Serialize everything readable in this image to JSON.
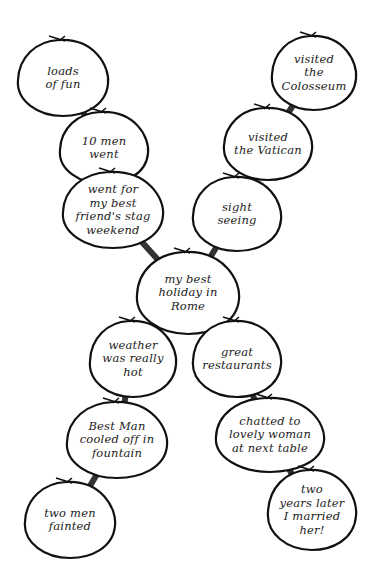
{
  "diagram": {
    "type": "fishbone-bubble-map",
    "central": {
      "id": "center",
      "label": "my best\nholiday in\nRome",
      "cx": 188,
      "cy": 293,
      "rx": 51,
      "ry": 41
    },
    "nodes": [
      {
        "id": "loads-of-fun",
        "label": "loads\nof fun",
        "cx": 63,
        "cy": 78,
        "rx": 45,
        "ry": 38
      },
      {
        "id": "ten-men-went",
        "label": "10 men\nwent",
        "cx": 104,
        "cy": 148,
        "rx": 44,
        "ry": 36
      },
      {
        "id": "stag-weekend",
        "label": "went for\nmy best\nfriend's stag\nweekend",
        "cx": 113,
        "cy": 210,
        "rx": 50,
        "ry": 38
      },
      {
        "id": "colosseum",
        "label": "visited\nthe\nColosseum",
        "cx": 314,
        "cy": 73,
        "rx": 42,
        "ry": 37
      },
      {
        "id": "vatican",
        "label": "visited\nthe Vatican",
        "cx": 268,
        "cy": 144,
        "rx": 44,
        "ry": 36
      },
      {
        "id": "sight-seeing",
        "label": "sight\nseeing",
        "cx": 237,
        "cy": 214,
        "rx": 44,
        "ry": 37
      },
      {
        "id": "weather",
        "label": "weather\nwas really\nhot",
        "cx": 133,
        "cy": 359,
        "rx": 43,
        "ry": 38
      },
      {
        "id": "restaurants",
        "label": "great\nrestaurants",
        "cx": 237,
        "cy": 359,
        "rx": 44,
        "ry": 38
      },
      {
        "id": "best-man",
        "label": "Best Man\ncooled off in\nfountain",
        "cx": 117,
        "cy": 440,
        "rx": 50,
        "ry": 38
      },
      {
        "id": "chatted",
        "label": "chatted to\nlovely woman\nat next table",
        "cx": 270,
        "cy": 435,
        "rx": 54,
        "ry": 37
      },
      {
        "id": "fainted",
        "label": "two men\nfainted",
        "cx": 70,
        "cy": 520,
        "rx": 45,
        "ry": 38
      },
      {
        "id": "married",
        "label": "two\nyears later\nI married\nher!",
        "cx": 312,
        "cy": 510,
        "rx": 44,
        "ry": 40
      }
    ],
    "connectors": [
      {
        "from": "loads-of-fun",
        "to": "ten-men-went"
      },
      {
        "from": "ten-men-went",
        "to": "stag-weekend"
      },
      {
        "from": "stag-weekend",
        "to": "center"
      },
      {
        "from": "colosseum",
        "to": "vatican"
      },
      {
        "from": "vatican",
        "to": "sight-seeing"
      },
      {
        "from": "sight-seeing",
        "to": "center"
      },
      {
        "from": "center",
        "to": "weather"
      },
      {
        "from": "center",
        "to": "restaurants"
      },
      {
        "from": "weather",
        "to": "best-man"
      },
      {
        "from": "best-man",
        "to": "fainted"
      },
      {
        "from": "restaurants",
        "to": "chatted"
      },
      {
        "from": "chatted",
        "to": "married"
      }
    ],
    "colors": {
      "stroke": "#111111",
      "connector": "#333333",
      "fill": "#ffffff",
      "text": "#222222"
    }
  }
}
